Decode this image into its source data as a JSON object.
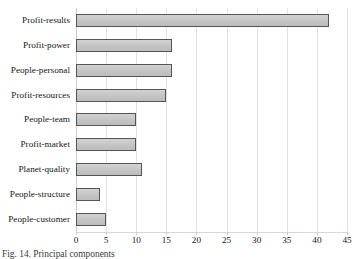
{
  "chart_data": {
    "type": "bar",
    "orientation": "horizontal",
    "title": "",
    "subtitle": "",
    "xlabel": "",
    "ylabel": "",
    "categories": [
      "Profit-results",
      "Profit-power",
      "People-personal",
      "Profit-resources",
      "People-team",
      "Profit-market",
      "Planet-quality",
      "People-structure",
      "People-customer"
    ],
    "values": [
      42,
      16,
      16,
      15,
      10,
      10,
      11,
      4,
      5
    ],
    "xlim": [
      0,
      45
    ],
    "xticks": [
      0,
      5,
      10,
      15,
      20,
      25,
      30,
      35,
      40,
      45
    ],
    "xtick_labels": [
      "0",
      "5",
      "10",
      "15",
      "20",
      "25",
      "30",
      "35",
      "40",
      "45"
    ],
    "grid": true,
    "grid_axis": "x",
    "legend": null,
    "bar_fill_color": "#c8c8c8",
    "bar_border_color": "#555555",
    "gridline_color": "#e3e3e3",
    "background_color": "#ffffff"
  },
  "figure": {
    "caption": "Fig. 14. Principal components"
  }
}
